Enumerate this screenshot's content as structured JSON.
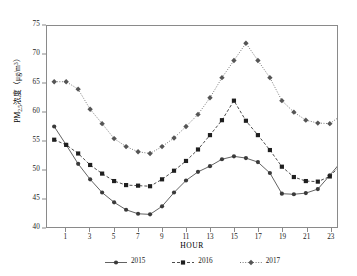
{
  "chart_data": {
    "type": "line",
    "title": "",
    "xlabel": "HOUR",
    "ylabel": "PM2.5浓度（μg/m³）",
    "ylabel_parts": {
      "prefix": "PM",
      "subscript": "2.5",
      "middle": "浓度（",
      "unit_prefix": "μg/m",
      "superscript": "3",
      "suffix": "）"
    },
    "x": [
      0,
      1,
      2,
      3,
      4,
      5,
      6,
      7,
      8,
      9,
      10,
      11,
      12,
      13,
      14,
      15,
      16,
      17,
      18,
      19,
      20,
      21,
      22,
      23
    ],
    "xtick_labels": [
      "1",
      "3",
      "5",
      "7",
      "9",
      "11",
      "13",
      "15",
      "17",
      "19",
      "21",
      "23"
    ],
    "xtick_values": [
      1,
      3,
      5,
      7,
      9,
      11,
      13,
      15,
      17,
      19,
      21,
      23
    ],
    "xlim": [
      -0.6,
      23.6
    ],
    "ytick_labels": [
      "40",
      "45",
      "50",
      "55",
      "60",
      "65",
      "70",
      "75"
    ],
    "ytick_values": [
      40,
      45,
      50,
      55,
      60,
      65,
      70,
      75
    ],
    "ylim": [
      40,
      75
    ],
    "grid": false,
    "legend_position": "bottom-center",
    "series": [
      {
        "name": "2015",
        "marker": "circle",
        "linestyle": "solid",
        "color": "#3a3a3a",
        "values": [
          57.5,
          54.3,
          51.0,
          48.3,
          46.0,
          44.3,
          43.0,
          42.3,
          42.2,
          43.6,
          46.0,
          48.1,
          49.6,
          50.6,
          51.8,
          52.3,
          52.0,
          51.3,
          49.4,
          45.8,
          45.7,
          45.9,
          46.6,
          49.0
        ]
      },
      {
        "name": "2016",
        "marker": "square",
        "linestyle": "dashed",
        "color": "#1f1f1f",
        "values": [
          55.2,
          54.3,
          52.8,
          50.8,
          49.3,
          48.0,
          47.3,
          47.2,
          47.1,
          48.3,
          49.8,
          51.5,
          53.5,
          56.0,
          58.6,
          62.0,
          58.5,
          56.0,
          53.4,
          50.5,
          48.7,
          48.0,
          47.9,
          48.8
        ]
      },
      {
        "name": "2017",
        "marker": "diamond",
        "linestyle": "dotted",
        "color": "#555555",
        "values": [
          65.3,
          65.3,
          64.0,
          60.5,
          58.0,
          55.4,
          54.0,
          53.1,
          52.8,
          54.0,
          55.5,
          57.5,
          59.6,
          62.5,
          66.0,
          69.0,
          72.0,
          69.0,
          66.0,
          62.0,
          60.0,
          58.6,
          58.1,
          58.0
        ]
      }
    ],
    "tail_segments": [
      {
        "series": "2015",
        "x": [
          23,
          24,
          25,
          26
        ],
        "values": [
          49.0,
          51.5,
          54.5,
          55.0
        ]
      },
      {
        "series": "2016",
        "x": [
          23,
          24,
          25,
          26
        ],
        "values": [
          48.8,
          51.0,
          53.8,
          55.0
        ]
      },
      {
        "series": "2017",
        "x": [
          23,
          24,
          25,
          26
        ],
        "values": [
          58.0,
          59.5,
          62.5,
          65.8
        ]
      }
    ]
  },
  "legend": {
    "entries": [
      {
        "label": "2015"
      },
      {
        "label": "2016"
      },
      {
        "label": "2017"
      }
    ]
  },
  "axes": {
    "x_title": "HOUR",
    "y_title": "PM2.5浓度（μg/m³）"
  }
}
